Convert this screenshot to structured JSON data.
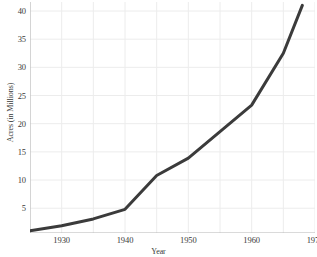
{
  "chart_data": {
    "type": "line",
    "title": "",
    "xlabel": "Year",
    "ylabel": "Acres (in Millions)",
    "xlim": [
      1925,
      1970
    ],
    "ylim": [
      0.6,
      41.6
    ],
    "grid": true,
    "legend": null,
    "legend_position": "none",
    "xticks": [
      1930,
      1940,
      1950,
      1960,
      1970
    ],
    "yticks": [
      5,
      10,
      15,
      20,
      25,
      30,
      35,
      40
    ],
    "series": [
      {
        "name": "Acres",
        "color": "#3b3b3b",
        "line_width": 3,
        "x": [
          1925,
          1930,
          1935,
          1940,
          1945,
          1950,
          1955,
          1960,
          1965,
          1968
        ],
        "values": [
          1.0,
          1.9,
          3.1,
          4.8,
          10.8,
          13.9,
          18.6,
          23.3,
          32.5,
          41.0
        ]
      }
    ]
  },
  "axes": {
    "y_tick_labels": [
      "40",
      "35",
      "30",
      "25",
      "20",
      "15",
      "10",
      "5"
    ],
    "x_tick_labels": [
      "1930",
      "1940",
      "1950",
      "1960",
      "1970"
    ],
    "x_title": "Year",
    "y_title": "Acres (in Millions)"
  },
  "style": {
    "background": "#ffffff",
    "grid_color": "#ececec",
    "axis_color": "#b4b4b4",
    "tick_text_color": "#3a3a3a",
    "line_color": "#3b3b3b"
  }
}
